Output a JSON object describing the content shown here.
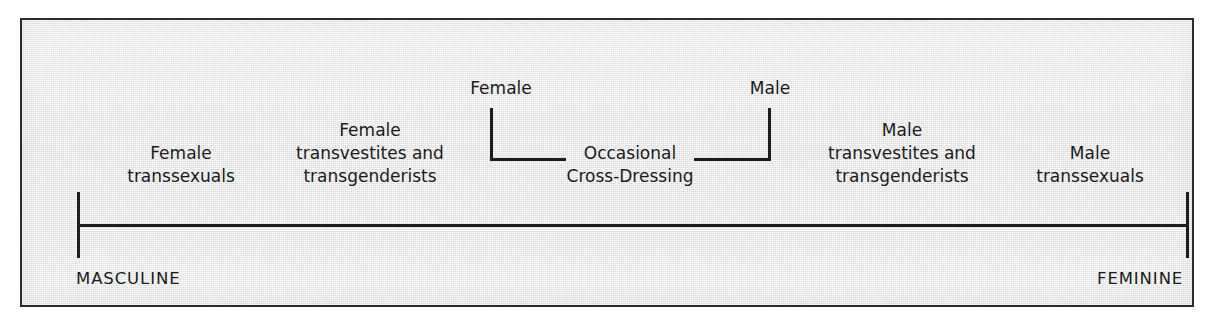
{
  "figure": {
    "type": "continuum-diagram",
    "background_color": "#e9e9e9",
    "border_color": "#2b2b2b",
    "ink_color": "#1d1d1d"
  },
  "axis": {
    "name": "gender-continuum-axis",
    "left_pole": "MASCULINE",
    "right_pole": "FEMININE"
  },
  "categories": [
    {
      "id": "female-transsexuals",
      "lines": [
        "Female",
        "transsexuals"
      ]
    },
    {
      "id": "female-transvestites-and-transgenderists",
      "lines": [
        "Female",
        "transvestites and",
        "transgenderists"
      ]
    },
    {
      "id": "occasional-cross-dressing",
      "lines": [
        "Occasional",
        "Cross-Dressing"
      ]
    },
    {
      "id": "male-transvestites-and-transgenderists",
      "lines": [
        "Male",
        "transvestites and",
        "transgenderists"
      ]
    },
    {
      "id": "male-transsexuals",
      "lines": [
        "Male",
        "transsexuals"
      ]
    }
  ],
  "callouts": [
    {
      "id": "female-callout",
      "label": "Female"
    },
    {
      "id": "male-callout",
      "label": "Male"
    }
  ],
  "chart_data": {
    "type": "line",
    "title": "",
    "xlabel": "",
    "ylabel": "",
    "axis_endpoints": [
      "MASCULINE",
      "FEMININE"
    ],
    "categories": [
      "Female transsexuals",
      "Female transvestites and transgenderists",
      "Occasional Cross-Dressing",
      "Male transvestites and transgenderists",
      "Male transsexuals"
    ],
    "annotations": [
      "Female",
      "Male"
    ],
    "grid": false,
    "legend": "none"
  }
}
